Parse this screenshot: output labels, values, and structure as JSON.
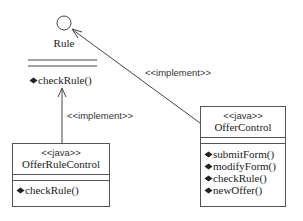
{
  "diagram": {
    "type": "UML class diagram",
    "interface": {
      "name": "Rule",
      "notation": "lollipop-circle",
      "operations": [
        "checkRule()"
      ]
    },
    "classes": [
      {
        "id": "offer-rule-control",
        "stereotype": "<<java>>",
        "name": "OfferRuleControl",
        "operations": [
          "checkRule()"
        ]
      },
      {
        "id": "offer-control",
        "stereotype": "<<java>>",
        "name": "OfferControl",
        "operations": [
          "submitForm()",
          "modifyForm()",
          "checkRule()",
          "newOffer()"
        ]
      }
    ],
    "relations": [
      {
        "from": "OfferRuleControl",
        "to": "Rule",
        "label": "<<implement>>"
      },
      {
        "from": "OfferControl",
        "to": "Rule",
        "label": "<<implement>>"
      }
    ]
  }
}
